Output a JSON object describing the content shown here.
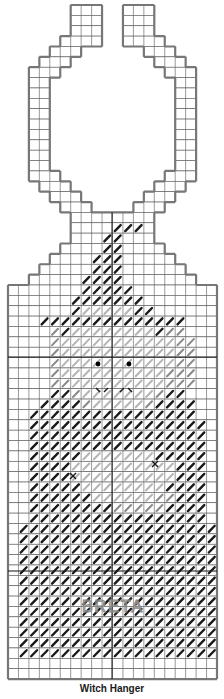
{
  "title": "Witch Hanger",
  "grid": {
    "cols": 20,
    "rows": 65,
    "origin_x": 8,
    "origin_y": 5,
    "cell_w": 10.45,
    "cell_h": 10.37,
    "line_color": "#555555",
    "outline_color": "#777777",
    "center_line_color": "#111111"
  },
  "colors": {
    "black_stitch": "#1a1a1a",
    "gray_stitch": "#8a8a8a",
    "light_gray_stitch": "#b5b5b5",
    "eye": "#000000",
    "bead": "#7a7a7a"
  },
  "canvas_rows": [
    [
      6,
      9
    ],
    [
      6,
      9
    ],
    [
      6,
      9
    ],
    [
      5,
      9
    ],
    [
      4,
      7
    ],
    [
      3,
      6
    ],
    [
      2,
      5
    ],
    [
      2,
      4
    ],
    [
      2,
      4
    ],
    [
      2,
      4
    ],
    [
      2,
      4
    ],
    [
      2,
      4
    ],
    [
      2,
      4
    ],
    [
      2,
      4
    ],
    [
      2,
      4
    ],
    [
      2,
      4
    ],
    [
      2,
      5
    ],
    [
      3,
      6
    ],
    [
      4,
      7
    ],
    [
      5,
      8
    ],
    [
      6,
      14
    ],
    [
      6,
      14
    ],
    [
      6,
      14
    ],
    [
      5,
      15
    ],
    [
      4,
      16
    ],
    [
      3,
      17
    ],
    [
      2,
      18
    ],
    [
      0,
      20
    ]
  ],
  "ring_rows_right": [
    [
      11,
      14
    ],
    [
      11,
      14
    ],
    [
      11,
      14
    ],
    [
      11,
      15
    ],
    [
      13,
      16
    ],
    [
      14,
      17
    ],
    [
      15,
      18
    ],
    [
      16,
      18
    ],
    [
      16,
      18
    ],
    [
      16,
      18
    ],
    [
      16,
      18
    ],
    [
      16,
      18
    ],
    [
      16,
      18
    ],
    [
      16,
      18
    ],
    [
      16,
      18
    ],
    [
      16,
      18
    ],
    [
      15,
      18
    ],
    [
      14,
      17
    ],
    [
      13,
      16
    ],
    [
      12,
      15
    ]
  ],
  "stitch_legend": {
    "z": "black continental stitch",
    "g": "gray stitch",
    "l": "light gray stitch"
  },
  "stitch_rows": [
    {
      "row": 21,
      "cells": "..........zzz......."
    },
    {
      "row": 22,
      "cells": ".........zz........."
    },
    {
      "row": 23,
      "cells": ".........zz........."
    },
    {
      "row": 24,
      "cells": "........zzz........."
    },
    {
      "row": 25,
      "cells": "........zzz........."
    },
    {
      "row": 26,
      "cells": ".......zzzz........."
    },
    {
      "row": 27,
      "cells": ".......zzzzz........"
    },
    {
      "row": 28,
      "cells": "......zzzzzzz......."
    },
    {
      "row": 29,
      "cells": "......zlllllzz......"
    },
    {
      "row": 30,
      "cells": "...zzzzzzzzzzzzzz..."
    },
    {
      "row": 31,
      "cells": "....gzllllllllzgg..."
    },
    {
      "row": 32,
      "cells": "....glllllllllllgg.."
    },
    {
      "row": 33,
      "cells": "....glllllllllllgg.."
    },
    {
      "row": 34,
      "cells": "....glllllllllllgg.."
    },
    {
      "row": 35,
      "cells": "....gllllllllllggg.."
    },
    {
      "row": 36,
      "cells": "....gglllllllllggg.."
    },
    {
      "row": 37,
      "cells": "....zzglllllllgzz..."
    },
    {
      "row": 38,
      "cells": "...zzzzglllllgzzzz.."
    },
    {
      "row": 39,
      "cells": "..zzzzzzzzzzzzzzzz.."
    },
    {
      "row": 40,
      "cells": "..zzzzzzzzzzzzzzzzz."
    },
    {
      "row": 41,
      "cells": "..zzzzzzzzzzzzzzzzz."
    },
    {
      "row": 42,
      "cells": "..zzzzzzzzzzzzzzzzz."
    },
    {
      "row": 43,
      "cells": "..zzzzzlllllllzzzzz."
    },
    {
      "row": 44,
      "cells": "..zzzzllllllllllzzz."
    },
    {
      "row": 45,
      "cells": "..zzzzllllllllllzzz."
    },
    {
      "row": 46,
      "cells": "..zzzzzllllllllzzzz."
    },
    {
      "row": 47,
      "cells": "..zzzzzzllllllggzzz."
    },
    {
      "row": 48,
      "cells": "..zzzzzzzzgggggzzzz."
    },
    {
      "row": 49,
      "cells": "..zzzzzzzzzzzzzzzzz."
    },
    {
      "row": 50,
      "cells": ".zzzzzzzzzzzzzzzzzzz"
    },
    {
      "row": 51,
      "cells": ".zzzzzzzzzzzzzzzzzzz"
    },
    {
      "row": 52,
      "cells": ".zzzzzzzzzzzzzzzzzzz"
    },
    {
      "row": 53,
      "cells": ".zzzzzzzzzzzzzzzzzzz"
    },
    {
      "row": 54,
      "cells": ".zzzzzzzzzzzzzzzzzzz"
    },
    {
      "row": 55,
      "cells": ".zzzzzzzzzzzzzzzzzzz"
    },
    {
      "row": 56,
      "cells": ".zzzzzzzzzzzzzzzzzzz"
    },
    {
      "row": 57,
      "cells": ".zzzzzzzzzzzzzzzzzzz"
    },
    {
      "row": 58,
      "cells": ".zzzzzzzzzzzzzzzzzzz"
    },
    {
      "row": 59,
      "cells": ".zzzzzzzzzzzzzzzzzzz"
    },
    {
      "row": 60,
      "cells": ".zzzzzzzzzzzzzzzzzzz"
    },
    {
      "row": 61,
      "cells": ".zzzzzzzzzzzzzzzzzzz"
    },
    {
      "row": 62,
      "cells": ".zzzzzzzzzzzzzzzzzzz"
    }
  ],
  "eyes": [
    {
      "x": 98,
      "y": 364
    },
    {
      "x": 129,
      "y": 364
    }
  ],
  "mouth_marks": [
    {
      "x1": 96,
      "y1": 388,
      "x2": 100,
      "y2": 392
    },
    {
      "x1": 104,
      "y1": 392,
      "x2": 108,
      "y2": 388
    },
    {
      "x1": 120,
      "y1": 392,
      "x2": 124,
      "y2": 388
    },
    {
      "x1": 128,
      "y1": 388,
      "x2": 132,
      "y2": 392
    }
  ],
  "x_marks": [
    {
      "x": 73,
      "y": 476
    },
    {
      "x": 155,
      "y": 464
    }
  ],
  "backstitch_lettering": {
    "text": "BRETA",
    "x": 70,
    "y": 597,
    "w": 86,
    "h": 18,
    "color": "#8a8a8a"
  },
  "center_lines": {
    "vertical_x": 112,
    "horizontal_y": [
      357,
      571
    ]
  }
}
